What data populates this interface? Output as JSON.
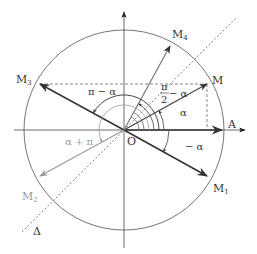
{
  "diagram": {
    "type": "trigonometric-circle",
    "colors": {
      "dark": "#333333",
      "light": "#9a9a9a",
      "dashed": "#555555",
      "background": "#ffffff"
    },
    "points": {
      "origin": {
        "label": "O"
      },
      "A": {
        "label": "A"
      },
      "M": {
        "label": "M"
      },
      "M1": {
        "label": "M",
        "sub": "1"
      },
      "M2": {
        "label": "M",
        "sub": "2"
      },
      "M3": {
        "label": "M",
        "sub": "3"
      },
      "M4": {
        "label": "M",
        "sub": "4"
      }
    },
    "line_labels": {
      "delta": "Δ"
    },
    "angle_labels": {
      "alpha": "α",
      "minus_alpha": "− α",
      "pi_minus_alpha": "π − α",
      "pi_over_2_num": "π",
      "pi_over_2_den": "2",
      "pi_over_2_minus": "− α",
      "alpha_plus_pi": "α + π"
    }
  }
}
